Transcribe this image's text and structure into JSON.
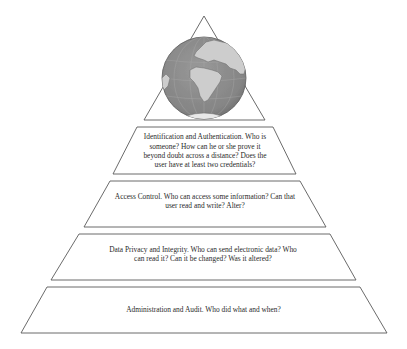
{
  "diagram": {
    "type": "pyramid",
    "apex": {
      "shape": "triangle",
      "icon": "globe-icon",
      "colors": {
        "ocean": "#8c8c8c",
        "land": "#cdcdcd",
        "outline": "#555555"
      }
    },
    "tiers": [
      {
        "id": "identification",
        "text": "Identification and Authentication. Who is someone? How can he or she prove it beyond doubt across a distance? Does the user have at least two credentials?"
      },
      {
        "id": "access-control",
        "text": "Access Control. Who can access some information? Can that user read and write? Alter?"
      },
      {
        "id": "data-privacy",
        "text": "Data Privacy and Integrity. Who can send electronic data? Who can read it? Can it be changed? Was it altered?"
      },
      {
        "id": "administration",
        "text": "Administration and Audit. Who did what and when?"
      }
    ],
    "stroke_color": "#5a5a5a",
    "background": "#ffffff"
  }
}
